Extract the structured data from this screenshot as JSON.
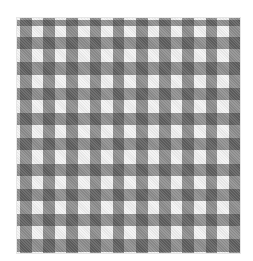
{
  "image": {
    "subject": "gingham check fabric swatch",
    "pattern": "gingham",
    "colors": {
      "background": "#ffffff",
      "light": "#f3f3f3",
      "medium": "#9e9e9e",
      "dark": "#555555"
    },
    "swatch": {
      "x": 17,
      "y": 18,
      "width": 223,
      "height": 235
    },
    "columns": {
      "first_dark_offset": 3,
      "period": 23.2,
      "dark_width": 11.5,
      "count": 10
    },
    "rows": {
      "first_dark_offset": 2,
      "period": 25.3,
      "dark_width": 12.3,
      "count": 10,
      "first_partial_height": 6
    }
  }
}
